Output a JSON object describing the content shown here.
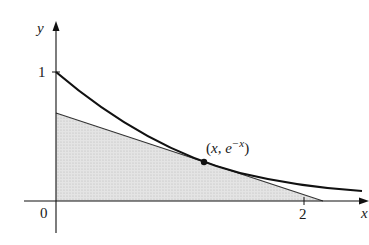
{
  "diagram": {
    "axes": {
      "x_label": "x",
      "y_label": "y",
      "origin_label": "0",
      "x_tick_label": "2",
      "y_tick_label": "1"
    },
    "point_label": {
      "open": "(",
      "x": "x",
      "comma": ", e",
      "exponent": "−x",
      "close": ")"
    },
    "colors": {
      "curve": "#111111",
      "tangent": "#333333",
      "shade": "#d9d9d9",
      "axis": "#111111"
    }
  }
}
